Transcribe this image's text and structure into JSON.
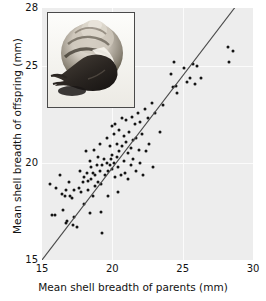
{
  "chart_data": {
    "type": "scatter",
    "title": "",
    "xlabel": "Mean shell breadth of parents (mm)",
    "ylabel": "Mean shell breadth of offspring (mm)",
    "xlim": [
      15,
      30
    ],
    "ylim": [
      15,
      28
    ],
    "xticks": [
      15,
      20,
      25,
      30
    ],
    "yticks": [
      15,
      20,
      25,
      28
    ],
    "xtick_labels": [
      "15",
      "20",
      "25",
      "30"
    ],
    "ytick_labels": [
      "15",
      "20",
      "25",
      "28"
    ],
    "grid": true,
    "gridlines_x": [
      20,
      25
    ],
    "gridlines_y": [
      20,
      25
    ],
    "legend": null,
    "point_color": "#141414",
    "panel_color": "#ededed",
    "line_color": "#4a4a4a",
    "series": [
      {
        "name": "Snail families",
        "marker": "filled-circle",
        "points": [
          [
            15.6,
            18.9
          ],
          [
            15.7,
            17.3
          ],
          [
            15.9,
            17.3
          ],
          [
            16.0,
            18.7
          ],
          [
            16.3,
            19.4
          ],
          [
            16.4,
            18.4
          ],
          [
            16.5,
            17.6
          ],
          [
            16.6,
            18.3
          ],
          [
            16.7,
            18.6
          ],
          [
            16.7,
            16.9
          ],
          [
            16.8,
            17.0
          ],
          [
            16.9,
            19.0
          ],
          [
            17.0,
            18.3
          ],
          [
            17.1,
            18.2
          ],
          [
            17.2,
            16.8
          ],
          [
            17.3,
            18.6
          ],
          [
            17.3,
            17.2
          ],
          [
            17.5,
            16.7
          ],
          [
            17.6,
            18.7
          ],
          [
            17.7,
            19.6
          ],
          [
            17.8,
            18.5
          ],
          [
            17.9,
            19.0
          ],
          [
            18.0,
            19.3
          ],
          [
            18.0,
            17.9
          ],
          [
            18.1,
            20.6
          ],
          [
            18.2,
            19.5
          ],
          [
            18.3,
            19.1
          ],
          [
            18.3,
            18.6
          ],
          [
            18.4,
            20.1
          ],
          [
            18.4,
            17.4
          ],
          [
            18.5,
            19.8
          ],
          [
            18.5,
            19.2
          ],
          [
            18.6,
            19.5
          ],
          [
            18.6,
            18.3
          ],
          [
            18.7,
            20.7
          ],
          [
            18.8,
            19.4
          ],
          [
            18.8,
            18.8
          ],
          [
            18.9,
            19.9
          ],
          [
            19.0,
            20.3
          ],
          [
            19.0,
            19.0
          ],
          [
            19.1,
            21.0
          ],
          [
            19.1,
            19.6
          ],
          [
            19.2,
            18.9
          ],
          [
            19.2,
            17.5
          ],
          [
            19.3,
            19.9
          ],
          [
            19.3,
            16.4
          ],
          [
            19.4,
            20.2
          ],
          [
            19.5,
            19.4
          ],
          [
            19.6,
            21.3
          ],
          [
            19.6,
            20.0
          ],
          [
            19.7,
            19.6
          ],
          [
            19.7,
            18.3
          ],
          [
            19.8,
            20.9
          ],
          [
            19.8,
            19.9
          ],
          [
            19.9,
            20.2
          ],
          [
            20.0,
            21.9
          ],
          [
            20.0,
            20.4
          ],
          [
            20.0,
            19.7
          ],
          [
            20.1,
            21.5
          ],
          [
            20.1,
            20.0
          ],
          [
            20.2,
            22.0
          ],
          [
            20.2,
            19.3
          ],
          [
            20.3,
            21.0
          ],
          [
            20.3,
            20.3
          ],
          [
            20.4,
            19.8
          ],
          [
            20.4,
            18.5
          ],
          [
            20.5,
            21.7
          ],
          [
            20.5,
            20.6
          ],
          [
            20.6,
            19.4
          ],
          [
            20.7,
            22.3
          ],
          [
            20.7,
            20.9
          ],
          [
            20.8,
            21.4
          ],
          [
            20.8,
            20.1
          ],
          [
            20.9,
            19.5
          ],
          [
            21.0,
            22.2
          ],
          [
            21.0,
            21.1
          ],
          [
            21.1,
            20.5
          ],
          [
            21.1,
            19.2
          ],
          [
            21.2,
            23.1
          ],
          [
            21.2,
            21.6
          ],
          [
            21.3,
            20.8
          ],
          [
            21.3,
            19.9
          ],
          [
            21.4,
            22.4
          ],
          [
            21.5,
            21.2
          ],
          [
            21.5,
            20.2
          ],
          [
            21.6,
            22.0
          ],
          [
            21.7,
            21.3
          ],
          [
            21.7,
            19.6
          ],
          [
            21.8,
            22.6
          ],
          [
            21.9,
            20.7
          ],
          [
            22.0,
            22.1
          ],
          [
            22.0,
            20.0
          ],
          [
            22.1,
            21.5
          ],
          [
            22.2,
            19.4
          ],
          [
            22.3,
            22.8
          ],
          [
            22.4,
            20.6
          ],
          [
            22.5,
            22.3
          ],
          [
            22.6,
            21.0
          ],
          [
            22.8,
            23.1
          ],
          [
            22.9,
            19.8
          ],
          [
            23.0,
            22.6
          ],
          [
            23.4,
            21.6
          ],
          [
            23.6,
            23.0
          ],
          [
            24.2,
            24.6
          ],
          [
            24.3,
            23.9
          ],
          [
            24.4,
            25.2
          ],
          [
            24.5,
            24.0
          ],
          [
            24.6,
            23.6
          ],
          [
            25.1,
            24.9
          ],
          [
            25.3,
            24.2
          ],
          [
            25.5,
            24.4
          ],
          [
            25.7,
            25.1
          ],
          [
            25.9,
            24.1
          ],
          [
            26.0,
            25.0
          ],
          [
            26.3,
            24.4
          ],
          [
            28.2,
            26.0
          ],
          [
            28.3,
            25.2
          ],
          [
            28.6,
            25.8
          ]
        ]
      }
    ],
    "regression_line": {
      "x_start": 15.0,
      "y_start": 15.0,
      "x_end": 29.0,
      "y_end": 28.3
    },
    "inset": {
      "name": "snail-photograph",
      "description": "Land snail shell with extended body"
    }
  }
}
